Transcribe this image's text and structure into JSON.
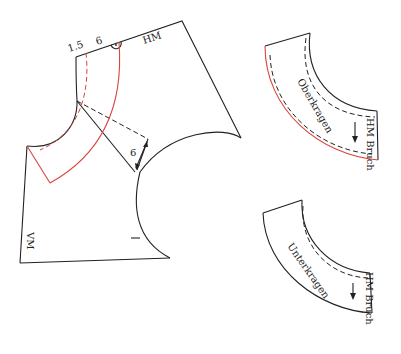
{
  "diagram": {
    "type": "sewing-pattern",
    "main_piece": {
      "labels": {
        "seam_allowance": "1.5",
        "collar_width": "6",
        "center_back": "HM",
        "center_front": "VM",
        "dart_measure": "6"
      }
    },
    "upper_collar": {
      "name": "Oberkragen",
      "fold_label": "HM Bruch"
    },
    "under_collar": {
      "name": "Unterkragen",
      "fold_label": "HM Bruch"
    },
    "colors": {
      "line": "#222222",
      "highlight": "#d9453c",
      "background": "#ffffff"
    }
  }
}
